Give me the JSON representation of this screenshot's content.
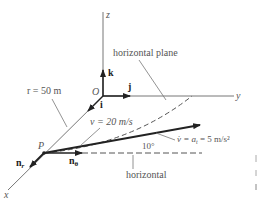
{
  "diagram": {
    "axes": {
      "z_label": "z",
      "y_label": "y",
      "x_label": "x",
      "origin_label": "O"
    },
    "unit_vectors": {
      "k": "k",
      "j": "j",
      "i": "i"
    },
    "annotations": {
      "horizontal_plane": "horizontal plane",
      "radius": "r = 50 m",
      "velocity": "v = 20 m/s",
      "angle": "10°",
      "acceleration": "v̇ = a",
      "acceleration_sub": "t",
      "acceleration_rest": " = 5 m/s²",
      "horizontal": "horizontal",
      "point": "P",
      "n_r": "n",
      "n_r_sub": "r",
      "n_theta": "n",
      "n_theta_sub": "θ"
    },
    "colors": {
      "line": "#555555",
      "arrow": "#222222",
      "text": "#555555"
    }
  }
}
